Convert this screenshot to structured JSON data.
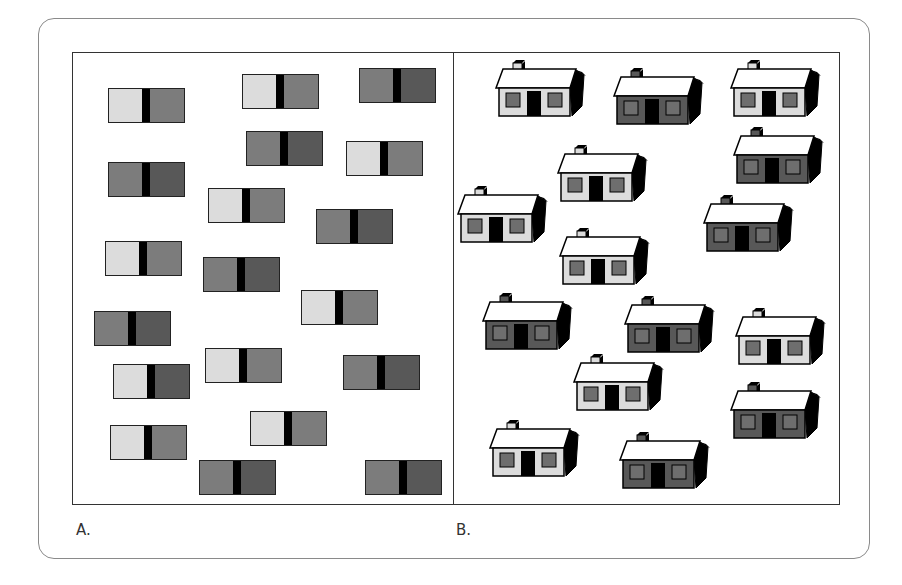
{
  "colors": {
    "light": "#dcdcdc",
    "medium": "#7c7c7c",
    "dark": "#585858",
    "black": "#000000",
    "roof": "#ffffff",
    "window": "#6e6e6e"
  },
  "panels": {
    "a": {
      "label": "A."
    },
    "b": {
      "label": "B."
    }
  },
  "rectangles": [
    {
      "x": 108,
      "y": 88,
      "left": "light",
      "right": "medium"
    },
    {
      "x": 242,
      "y": 74,
      "left": "light",
      "right": "medium"
    },
    {
      "x": 359,
      "y": 68,
      "left": "medium",
      "right": "dark"
    },
    {
      "x": 246,
      "y": 131,
      "left": "medium",
      "right": "dark"
    },
    {
      "x": 346,
      "y": 141,
      "left": "light",
      "right": "medium"
    },
    {
      "x": 108,
      "y": 162,
      "left": "medium",
      "right": "dark"
    },
    {
      "x": 208,
      "y": 188,
      "left": "light",
      "right": "medium"
    },
    {
      "x": 316,
      "y": 209,
      "left": "medium",
      "right": "dark"
    },
    {
      "x": 105,
      "y": 241,
      "left": "light",
      "right": "medium"
    },
    {
      "x": 203,
      "y": 257,
      "left": "medium",
      "right": "dark"
    },
    {
      "x": 301,
      "y": 290,
      "left": "light",
      "right": "medium"
    },
    {
      "x": 94,
      "y": 311,
      "left": "medium",
      "right": "dark"
    },
    {
      "x": 205,
      "y": 348,
      "left": "light",
      "right": "medium"
    },
    {
      "x": 113,
      "y": 364,
      "left": "light",
      "right": "dark"
    },
    {
      "x": 343,
      "y": 355,
      "left": "medium",
      "right": "dark"
    },
    {
      "x": 250,
      "y": 411,
      "left": "light",
      "right": "medium"
    },
    {
      "x": 110,
      "y": 425,
      "left": "light",
      "right": "medium"
    },
    {
      "x": 199,
      "y": 460,
      "left": "medium",
      "right": "dark"
    },
    {
      "x": 365,
      "y": 460,
      "left": "medium",
      "right": "dark"
    }
  ],
  "houses": [
    {
      "x": 496,
      "y": 60,
      "shade": "light"
    },
    {
      "x": 614,
      "y": 68,
      "shade": "dark"
    },
    {
      "x": 731,
      "y": 60,
      "shade": "light"
    },
    {
      "x": 558,
      "y": 145,
      "shade": "light"
    },
    {
      "x": 734,
      "y": 127,
      "shade": "dark"
    },
    {
      "x": 458,
      "y": 186,
      "shade": "light"
    },
    {
      "x": 704,
      "y": 195,
      "shade": "dark"
    },
    {
      "x": 560,
      "y": 228,
      "shade": "light"
    },
    {
      "x": 483,
      "y": 293,
      "shade": "dark"
    },
    {
      "x": 625,
      "y": 296,
      "shade": "dark"
    },
    {
      "x": 736,
      "y": 308,
      "shade": "light"
    },
    {
      "x": 574,
      "y": 354,
      "shade": "light"
    },
    {
      "x": 731,
      "y": 382,
      "shade": "dark"
    },
    {
      "x": 490,
      "y": 420,
      "shade": "light"
    },
    {
      "x": 620,
      "y": 432,
      "shade": "dark"
    }
  ]
}
